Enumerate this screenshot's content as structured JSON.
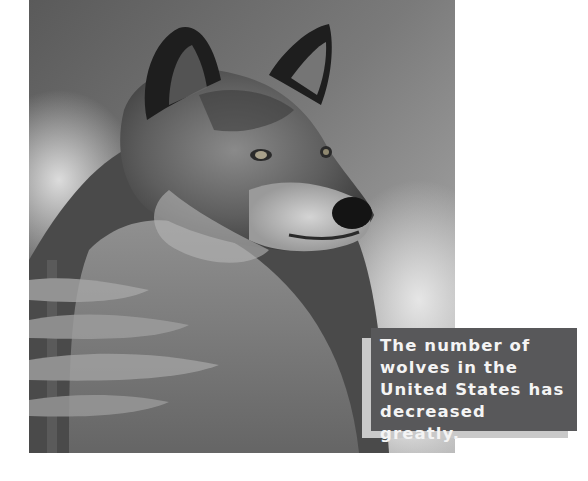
{
  "photo": {
    "subject": "gray wolf portrait",
    "style": "grayscale photograph",
    "alt": "A gray wolf looking to the right, with snowy pine branches in the foreground"
  },
  "caption": {
    "lines": [
      "The number of",
      "wolves in the",
      "United States has",
      "decreased greatly."
    ],
    "text": "The number of\nwolves in the\nUnited States has\ndecreased greatly."
  },
  "colors": {
    "page_background": "#ffffff",
    "caption_box": "#58585a",
    "caption_shadow": "#c9c9c9",
    "caption_text": "#f4f4f4"
  }
}
